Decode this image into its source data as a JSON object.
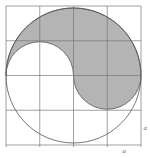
{
  "diagram": {
    "type": "geometry-figure",
    "grid": {
      "rows": 4,
      "cols": 4,
      "left": 6,
      "top": 6,
      "cell_w": 33.75,
      "cell_h": 34.75
    },
    "circle": {
      "cx": 73.5,
      "cy": 75.5,
      "r": 67.5
    },
    "colors": {
      "line": "#555555",
      "grid": "#777777",
      "shade": "#b4b4b4",
      "background": "#ffffff"
    },
    "labels": {
      "side_right": "a",
      "side_bottom": "a"
    }
  }
}
